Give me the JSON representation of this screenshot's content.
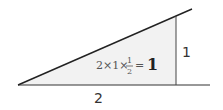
{
  "diagram": {
    "type": "right-triangle-area",
    "base_label": "2",
    "height_label": "1",
    "equation": {
      "left": "2×1×",
      "fraction_numerator": "1",
      "fraction_denominator": "2",
      "equals": "=",
      "result": "1"
    },
    "colors": {
      "stroke": "#333333",
      "fill": "#f2f2f2"
    }
  }
}
